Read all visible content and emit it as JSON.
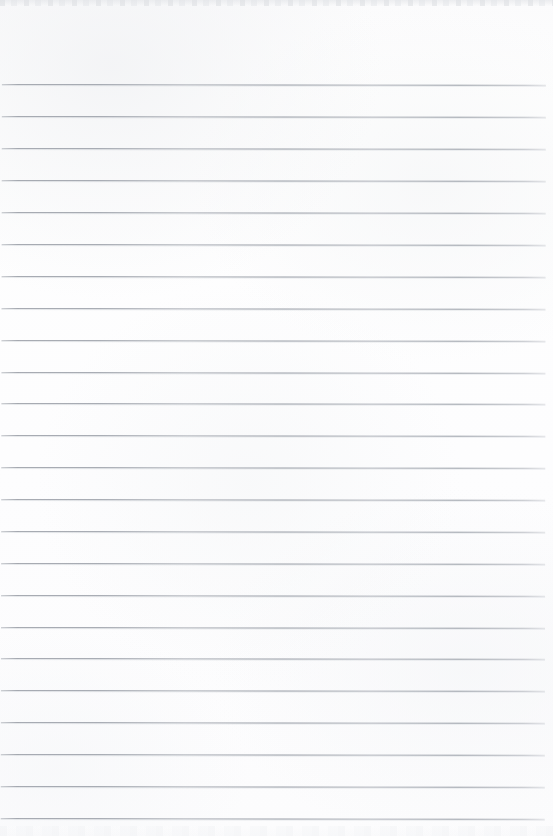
{
  "document": {
    "kind": "ruled-notebook-paper-scan",
    "title": "Blank Ruled Notebook Paper",
    "content_text": "",
    "has_handwriting": false,
    "has_printed_text": false,
    "has_vertical_margin_rule": false,
    "page_width_px": 553,
    "page_height_px": 836,
    "background_color": "#fdfdfd",
    "paper_tone_color": "#fbfbfc",
    "rule_color": "#a9adb4",
    "rule_count": 24,
    "rule_thickness_px": 1,
    "rule_spacing_px": 31.8,
    "first_rule_y_px": 84,
    "rule_left_x_px": 2,
    "rule_right_x_px": 546,
    "skew_degrees": 0.09,
    "top_header_height_px": 84,
    "scan_edge_top_height_px": 6,
    "scan_edge_bottom_height_px": 10
  },
  "rules": [
    {
      "index": 1,
      "y": 84,
      "left": 2,
      "width": 544
    },
    {
      "index": 2,
      "y": 116,
      "left": 2,
      "width": 544
    },
    {
      "index": 3,
      "y": 148,
      "left": 2,
      "width": 544
    },
    {
      "index": 4,
      "y": 180,
      "left": 2,
      "width": 544
    },
    {
      "index": 5,
      "y": 212,
      "left": 2,
      "width": 544
    },
    {
      "index": 6,
      "y": 244,
      "left": 2,
      "width": 544
    },
    {
      "index": 7,
      "y": 276,
      "left": 2,
      "width": 544
    },
    {
      "index": 8,
      "y": 308,
      "left": 2,
      "width": 544
    },
    {
      "index": 9,
      "y": 340,
      "left": 2,
      "width": 544
    },
    {
      "index": 10,
      "y": 372,
      "left": 2,
      "width": 544
    },
    {
      "index": 11,
      "y": 403,
      "left": 2,
      "width": 544
    },
    {
      "index": 12,
      "y": 435,
      "left": 2,
      "width": 544
    },
    {
      "index": 13,
      "y": 467,
      "left": 2,
      "width": 544
    },
    {
      "index": 14,
      "y": 499,
      "left": 2,
      "width": 544
    },
    {
      "index": 15,
      "y": 531,
      "left": 2,
      "width": 544
    },
    {
      "index": 16,
      "y": 563,
      "left": 2,
      "width": 544
    },
    {
      "index": 17,
      "y": 595,
      "left": 2,
      "width": 544
    },
    {
      "index": 18,
      "y": 627,
      "left": 2,
      "width": 544
    },
    {
      "index": 19,
      "y": 658,
      "left": 2,
      "width": 544
    },
    {
      "index": 20,
      "y": 690,
      "left": 2,
      "width": 544
    },
    {
      "index": 21,
      "y": 722,
      "left": 2,
      "width": 544
    },
    {
      "index": 22,
      "y": 754,
      "left": 2,
      "width": 544
    },
    {
      "index": 23,
      "y": 786,
      "left": 2,
      "width": 544
    },
    {
      "index": 24,
      "y": 818,
      "left": 2,
      "width": 544
    }
  ]
}
